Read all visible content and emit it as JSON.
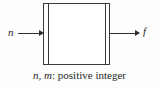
{
  "figure": {
    "type": "block-diagram",
    "background_color": "#fefefe",
    "line_color": "#3a3a3a",
    "text_color": "#262626",
    "block": {
      "name": "processing-block",
      "fill_color": "#ffffff",
      "has_double_side_rules": true
    },
    "signals": {
      "input": {
        "label": "n",
        "direction": "right",
        "position": "left"
      },
      "output": {
        "label": "f",
        "direction": "right",
        "position": "right"
      }
    },
    "caption": {
      "variables": "n, m",
      "separator": ":",
      "description": "positive integer",
      "full_text": "n, m: positive integer"
    }
  }
}
